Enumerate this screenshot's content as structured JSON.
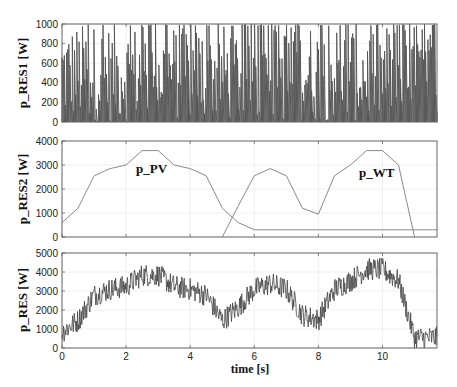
{
  "chart_data": [
    {
      "type": "line",
      "title": "",
      "xlabel": "",
      "ylabel": "p_RES1 [W]",
      "xlim": [
        0,
        11.7
      ],
      "ylim": [
        0,
        1000
      ],
      "yticks": [
        0,
        200,
        400,
        600,
        800,
        1000
      ],
      "xticks": [
        0,
        2,
        4,
        6,
        8,
        10
      ],
      "grid": true,
      "description": "Random fluctuating power between 0 and 1000 W, dense spikes",
      "series": [
        {
          "name": "p_RES1",
          "x_range": [
            0,
            11.7
          ],
          "min": 0,
          "max": 1000,
          "style": "dense-random"
        }
      ]
    },
    {
      "type": "line",
      "title": "",
      "xlabel": "",
      "ylabel": "p_RES2 [W]",
      "xlim": [
        0,
        11.7
      ],
      "ylim": [
        0,
        4000
      ],
      "yticks": [
        0,
        1000,
        2000,
        3000,
        4000
      ],
      "xticks": [
        0,
        2,
        4,
        6,
        8,
        10
      ],
      "grid": true,
      "annotations": [
        {
          "text": "p_PV",
          "x": 3.0,
          "y": 3100
        },
        {
          "text": "p_WT",
          "x": 9.5,
          "y": 3100
        }
      ],
      "series": [
        {
          "name": "p_PV",
          "x": [
            0,
            0.5,
            1,
            1.5,
            2,
            2.5,
            3,
            3.5,
            4,
            4.5,
            5,
            5.5,
            6,
            11.7
          ],
          "y": [
            600,
            1200,
            2550,
            2850,
            3000,
            3600,
            3600,
            3000,
            2850,
            2550,
            1200,
            600,
            300,
            300
          ]
        },
        {
          "name": "p_WT",
          "x": [
            5,
            5.5,
            6,
            6.5,
            7,
            7.5,
            8,
            8.5,
            9,
            9.5,
            10,
            10.5,
            11
          ],
          "y": [
            0,
            1300,
            2550,
            2850,
            2550,
            1200,
            950,
            2550,
            3000,
            3600,
            3600,
            3000,
            0
          ]
        }
      ]
    },
    {
      "type": "line",
      "title": "",
      "xlabel": "time [s]",
      "ylabel": "p_RES [W]",
      "xlim": [
        0,
        11.7
      ],
      "ylim": [
        0,
        5000
      ],
      "yticks": [
        0,
        1000,
        2000,
        3000,
        4000,
        5000
      ],
      "xticks": [
        0,
        2,
        4,
        6,
        8,
        10
      ],
      "grid": true,
      "description": "Sum p_RES1 + p_RES2: noisy signal following PV/WT envelope",
      "series": [
        {
          "name": "p_RES",
          "envelope_x": [
            0,
            0.5,
            1,
            1.5,
            2,
            2.5,
            3,
            3.5,
            4,
            4.5,
            5,
            5.5,
            6,
            6.5,
            7,
            7.5,
            8,
            8.5,
            9,
            9.5,
            10,
            10.5,
            11,
            11.7
          ],
          "envelope_y": [
            600,
            1200,
            2550,
            2850,
            3000,
            3600,
            3600,
            3000,
            2850,
            2550,
            1200,
            1900,
            2850,
            3150,
            2850,
            1500,
            1250,
            2850,
            3300,
            3900,
            3900,
            3300,
            300,
            300
          ],
          "noise_amplitude": 1000
        }
      ]
    }
  ],
  "panels": {
    "p1": {
      "ylabel": "p_RES1 [W]"
    },
    "p2": {
      "ylabel": "p_RES2 [W]",
      "anno_pv": "p_PV",
      "anno_wt": "p_WT"
    },
    "p3": {
      "ylabel": "p_RES [W]",
      "xlabel": "time [s]"
    }
  }
}
